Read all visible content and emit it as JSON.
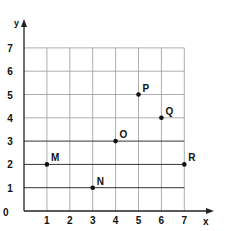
{
  "chart_data": {
    "type": "scatter",
    "title": "",
    "xlabel": "x",
    "ylabel": "y",
    "xlim": [
      0,
      7
    ],
    "ylim": [
      0,
      7
    ],
    "grid": true,
    "x_ticks": [
      "1",
      "2",
      "3",
      "4",
      "5",
      "6",
      "7"
    ],
    "y_ticks": [
      "1",
      "2",
      "3",
      "4",
      "5",
      "6",
      "7"
    ],
    "origin_label": "0",
    "points": [
      {
        "label": "M",
        "x": 1,
        "y": 2
      },
      {
        "label": "N",
        "x": 3,
        "y": 1
      },
      {
        "label": "O",
        "x": 4,
        "y": 3
      },
      {
        "label": "P",
        "x": 5,
        "y": 5
      },
      {
        "label": "Q",
        "x": 6,
        "y": 4
      },
      {
        "label": "R",
        "x": 7,
        "y": 2
      }
    ]
  },
  "colors": {
    "grid": "#999999",
    "axis": "#222222",
    "point": "#111111"
  }
}
